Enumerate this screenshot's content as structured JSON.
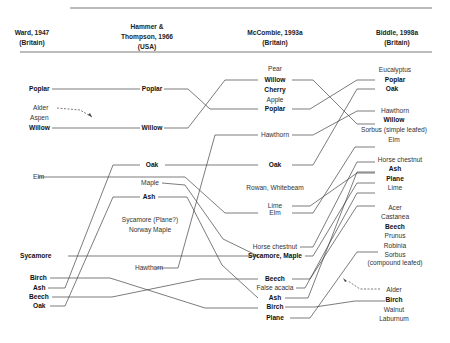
{
  "headers": [
    {
      "title": "Ward, 1947",
      "sub": "(Britain)"
    },
    {
      "title": "Hammer &",
      "title2": "Thompson, 1966",
      "sub": "(USA)"
    },
    {
      "title": "McCombie, 1993a",
      "sub": "(Britain)"
    },
    {
      "title": "Biddle, 1998a",
      "sub": "(Britain)"
    }
  ],
  "columns": {
    "ward": [
      "Poplar",
      "Alder",
      "Aspen",
      "Willow",
      "Elm",
      "Sycamore",
      "Birch",
      "Ash",
      "Beech",
      "Oak"
    ],
    "hammer": [
      "Poplar",
      "Willow",
      "Oak",
      "Maple",
      "Ash",
      "Sycamore (Plane?)",
      "Norway Maple",
      "Hawthorn"
    ],
    "mccombie": [
      "Pear",
      "Willow",
      "Cherry",
      "Apple",
      "Poplar",
      "Hawthorn",
      "Oak",
      "Rowan, Whitebeam",
      "Lime",
      "Elm",
      "Horse chestnut",
      "Sycamore, Maple",
      "Beech",
      "False acacia",
      "Ash",
      "Birch",
      "Plane"
    ],
    "biddle": [
      "Eucalyptus",
      "Poplar",
      "Oak",
      "Hawthorn",
      "Willow",
      "Sorbus (simple leafed)",
      "Elm",
      "Horse chestnut",
      "Ash",
      "Plane",
      "Lime",
      "Acer",
      "Castanea",
      "Beech",
      "Prunus",
      "Robinia",
      "Sorbus",
      "(compound leafed)",
      "Alder",
      "Birch",
      "Walnut",
      "Laburnum"
    ]
  },
  "line_color": "#444444"
}
